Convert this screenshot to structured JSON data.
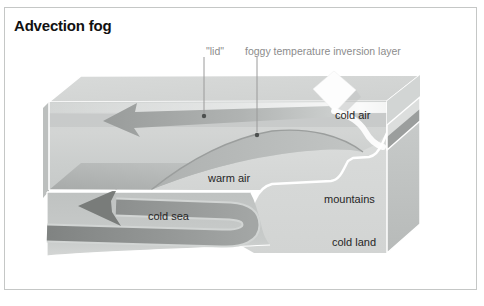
{
  "title": "Advection fog",
  "labels": {
    "lid": "\"lid\"",
    "inversion_layer": "foggy temperature inversion layer",
    "cold_air": "cold air",
    "warm_air": "warm air",
    "cold_sea": "cold sea",
    "mountains": "mountains",
    "cold_land": "cold land"
  },
  "colors": {
    "panel_border": "#c5c7c6",
    "title_text": "#111111",
    "callout_text": "#8c8c8c",
    "diagram_text": "#262626",
    "box_face_light": "#d4d6d5",
    "box_face_mid": "#c3c6c5",
    "inversion_wedge": "#b4b7b6",
    "air_arrow": "#9ea1a0",
    "sea_arrow": "#858887",
    "edge_highlight": "#ffffff"
  }
}
